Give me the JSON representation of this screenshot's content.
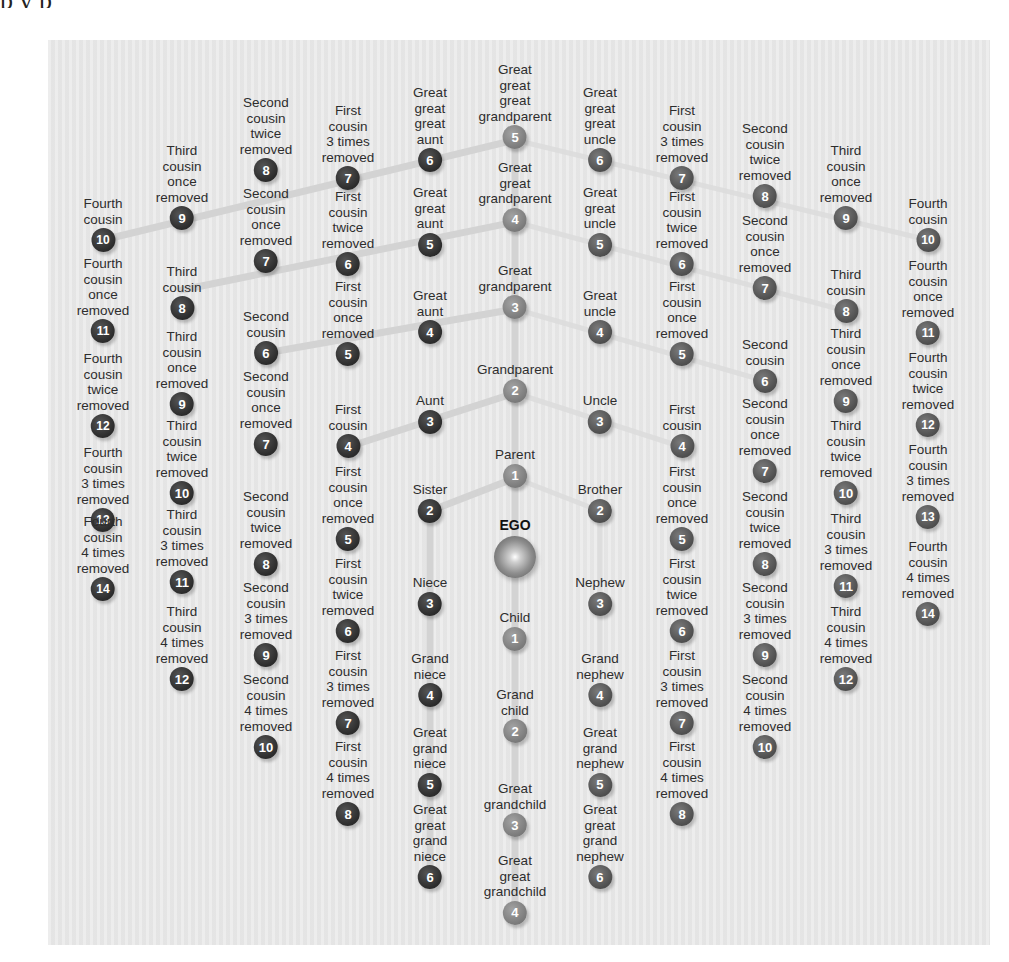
{
  "header": {
    "cut_text": "p        y                                p"
  },
  "colors": {
    "left_circle": "#2b2b2b",
    "center_circle": "#7a7a7a",
    "right_circle": "#4e4e4e",
    "panel": "#e9e9e9",
    "line": "#d2d2d2"
  },
  "ego": {
    "label": "EGO"
  },
  "center": [
    {
      "label": "Great\ngreat\ngreat\ngrandparent",
      "n": "5"
    },
    {
      "label": "Great\ngreat\ngrandparent",
      "n": "4"
    },
    {
      "label": "Great\ngrandparent",
      "n": "3"
    },
    {
      "label": "Grandparent",
      "n": "2"
    },
    {
      "label": "Parent",
      "n": "1"
    },
    {
      "label": "Child",
      "n": "1"
    },
    {
      "label": "Grand\nchild",
      "n": "2"
    },
    {
      "label": "Great\ngrandchild",
      "n": "3"
    },
    {
      "label": "Great\ngreat\ngrandchild",
      "n": "4"
    }
  ],
  "left": {
    "col4": [
      {
        "label": "Great\ngreat\ngreat\naunt",
        "n": "6"
      },
      {
        "label": "Great\ngreat\naunt",
        "n": "5"
      },
      {
        "label": "Great\naunt",
        "n": "4"
      },
      {
        "label": "Aunt",
        "n": "3"
      },
      {
        "label": "Sister",
        "n": "2"
      },
      {
        "label": "Niece",
        "n": "3"
      },
      {
        "label": "Grand\nniece",
        "n": "4"
      },
      {
        "label": "Great\ngrand\nniece",
        "n": "5"
      },
      {
        "label": "Great\ngreat\ngrand\nniece",
        "n": "6"
      }
    ],
    "col3": [
      {
        "label": "First\ncousin\n3 times\nremoved",
        "n": "7"
      },
      {
        "label": "First\ncousin\ntwice\nremoved",
        "n": "6"
      },
      {
        "label": "First\ncousin\nonce\nremoved",
        "n": "5"
      },
      {
        "label": "First\ncousin",
        "n": "4"
      },
      {
        "label": "First\ncousin\nonce\nremoved",
        "n": "5"
      },
      {
        "label": "First\ncousin\ntwice\nremoved",
        "n": "6"
      },
      {
        "label": "First\ncousin\n3 times\nremoved",
        "n": "7"
      },
      {
        "label": "First\ncousin\n4 times\nremoved",
        "n": "8"
      }
    ],
    "col2": [
      {
        "label": "Second\ncousin\ntwice\nremoved",
        "n": "8"
      },
      {
        "label": "Second\ncousin\nonce\nremoved",
        "n": "7"
      },
      {
        "label": "Second\ncousin",
        "n": "6"
      },
      {
        "label": "Second\ncousin\nonce\nremoved",
        "n": "7"
      },
      {
        "label": "Second\ncousin\ntwice\nremoved",
        "n": "8"
      },
      {
        "label": "Second\ncousin\n3 times\nremoved",
        "n": "9"
      },
      {
        "label": "Second\ncousin\n4 times\nremoved",
        "n": "10"
      }
    ],
    "col1": [
      {
        "label": "Third\ncousin\nonce\nremoved",
        "n": "9"
      },
      {
        "label": "Third\ncousin",
        "n": "8"
      },
      {
        "label": "Third\ncousin\nonce\nremoved",
        "n": "9"
      },
      {
        "label": "Third\ncousin\ntwice\nremoved",
        "n": "10"
      },
      {
        "label": "Third\ncousin\n3 times\nremoved",
        "n": "11"
      },
      {
        "label": "Third\ncousin\n4 times\nremoved",
        "n": "12"
      }
    ],
    "col0": [
      {
        "label": "Fourth\ncousin",
        "n": "10"
      },
      {
        "label": "Fourth\ncousin\nonce\nremoved",
        "n": "11"
      },
      {
        "label": "Fourth\ncousin\ntwice\nremoved",
        "n": "12"
      },
      {
        "label": "Fourth\ncousin\n3 times\nremoved",
        "n": "13"
      },
      {
        "label": "Fourth\ncousin\n4 times\nremoved",
        "n": "14"
      }
    ]
  },
  "right": {
    "col6": [
      {
        "label": "Great\ngreat\ngreat\nuncle",
        "n": "6"
      },
      {
        "label": "Great\ngreat\nuncle",
        "n": "5"
      },
      {
        "label": "Great\nuncle",
        "n": "4"
      },
      {
        "label": "Uncle",
        "n": "3"
      },
      {
        "label": "Brother",
        "n": "2"
      },
      {
        "label": "Nephew",
        "n": "3"
      },
      {
        "label": "Grand\nnephew",
        "n": "4"
      },
      {
        "label": "Great\ngrand\nnephew",
        "n": "5"
      },
      {
        "label": "Great\ngreat\ngrand\nnephew",
        "n": "6"
      }
    ],
    "col7": [
      {
        "label": "First\ncousin\n3 times\nremoved",
        "n": "7"
      },
      {
        "label": "First\ncousin\ntwice\nremoved",
        "n": "6"
      },
      {
        "label": "First\ncousin\nonce\nremoved",
        "n": "5"
      },
      {
        "label": "First\ncousin",
        "n": "4"
      },
      {
        "label": "First\ncousin\nonce\nremoved",
        "n": "5"
      },
      {
        "label": "First\ncousin\ntwice\nremoved",
        "n": "6"
      },
      {
        "label": "First\ncousin\n3 times\nremoved",
        "n": "7"
      },
      {
        "label": "First\ncousin\n4 times\nremoved",
        "n": "8"
      }
    ],
    "col8": [
      {
        "label": "Second\ncousin\ntwice\nremoved",
        "n": "8"
      },
      {
        "label": "Second\ncousin\nonce\nremoved",
        "n": "7"
      },
      {
        "label": "Second\ncousin",
        "n": "6"
      },
      {
        "label": "Second\ncousin\nonce\nremoved",
        "n": "7"
      },
      {
        "label": "Second\ncousin\ntwice\nremoved",
        "n": "8"
      },
      {
        "label": "Second\ncousin\n3 times\nremoved",
        "n": "9"
      },
      {
        "label": "Second\ncousin\n4 times\nremoved",
        "n": "10"
      }
    ],
    "col9": [
      {
        "label": "Third\ncousin\nonce\nremoved",
        "n": "9"
      },
      {
        "label": "Third\ncousin",
        "n": "8"
      },
      {
        "label": "Third\ncousin\nonce\nremoved",
        "n": "9"
      },
      {
        "label": "Third\ncousin\ntwice\nremoved",
        "n": "10"
      },
      {
        "label": "Third\ncousin\n3 times\nremoved",
        "n": "11"
      },
      {
        "label": "Third\ncousin\n4 times\nremoved",
        "n": "12"
      }
    ],
    "col10": [
      {
        "label": "Fourth\ncousin",
        "n": "10"
      },
      {
        "label": "Fourth\ncousin\nonce\nremoved",
        "n": "11"
      },
      {
        "label": "Fourth\ncousin\ntwice\nremoved",
        "n": "12"
      },
      {
        "label": "Fourth\ncousin\n3 times\nremoved",
        "n": "13"
      },
      {
        "label": "Fourth\ncousin\n4 times\nremoved",
        "n": "14"
      }
    ]
  }
}
